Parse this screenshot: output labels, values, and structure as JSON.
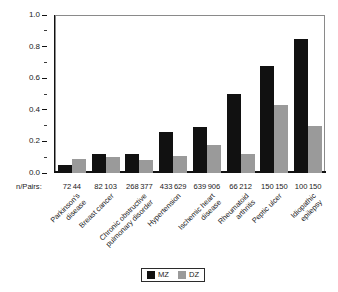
{
  "chart_data": {
    "type": "bar",
    "title": "",
    "xlabel": "",
    "ylabel": "Twin probandwise concordance",
    "ylim": [
      0.0,
      1.0
    ],
    "ytick_labels": [
      "0.0",
      "0.2",
      "0.4",
      "0.6",
      "0.8",
      "1.0"
    ],
    "ytick_values": [
      0.0,
      0.2,
      0.4,
      0.6,
      0.8,
      1.0
    ],
    "grid": false,
    "legend_position": "bottom-center",
    "categories": [
      "Parkinson's\ndisease",
      "Breast cancer",
      "Chronic obstructive\npulmonary disorder",
      "Hypertension",
      "Ischemic heart\ndisease",
      "Rheumatoid\narthritis",
      "Peptic ulcer",
      "Idiopathic\nepilepsy"
    ],
    "series": [
      {
        "name": "MZ",
        "color": "#111111",
        "values": [
          0.05,
          0.12,
          0.12,
          0.26,
          0.29,
          0.5,
          0.68,
          0.85
        ]
      },
      {
        "name": "DZ",
        "color": "#9a9a9a",
        "values": [
          0.09,
          0.1,
          0.08,
          0.11,
          0.18,
          0.12,
          0.43,
          0.3
        ]
      }
    ],
    "annotation_row_label": "n/Pairs:",
    "annotation_rows": [
      {
        "mz": "72",
        "dz": "44"
      },
      {
        "mz": "82",
        "dz": "103"
      },
      {
        "mz": "268",
        "dz": "377"
      },
      {
        "mz": "433",
        "dz": "629"
      },
      {
        "mz": "639",
        "dz": "906"
      },
      {
        "mz": "66",
        "dz": "212"
      },
      {
        "mz": "150",
        "dz": "150"
      },
      {
        "mz": "100",
        "dz": "150"
      }
    ]
  },
  "legend": {
    "items": [
      {
        "label": "MZ",
        "color": "#111111"
      },
      {
        "label": "DZ",
        "color": "#9a9a9a"
      }
    ]
  }
}
